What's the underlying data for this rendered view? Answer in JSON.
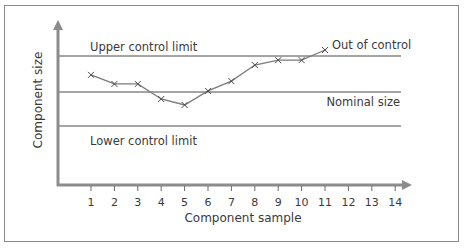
{
  "chart_data": {
    "type": "line",
    "title": "",
    "xlabel": "Component sample",
    "ylabel": "Component size",
    "x": [
      1,
      2,
      3,
      4,
      5,
      6,
      7,
      8,
      9,
      10,
      11,
      12,
      13,
      14
    ],
    "x_ticks": [
      "1",
      "2",
      "3",
      "4",
      "5",
      "6",
      "7",
      "8",
      "9",
      "10",
      "11",
      "12",
      "13",
      "14"
    ],
    "series": [
      {
        "name": "Component size",
        "marker": "x",
        "x": [
          1,
          2,
          3,
          4,
          5,
          6,
          7,
          8,
          9,
          10,
          11
        ],
        "values": [
          0.49,
          0.23,
          0.23,
          -0.2,
          -0.37,
          0.03,
          0.31,
          0.77,
          0.91,
          0.91,
          1.2
        ]
      }
    ],
    "reference_lines": [
      {
        "name": "Upper control limit",
        "value": 1,
        "label": "Upper control limit"
      },
      {
        "name": "Nominal size",
        "value": 0,
        "label": "Nominal size"
      },
      {
        "name": "Lower control limit",
        "value": -1,
        "label": "Lower control limit"
      }
    ],
    "annotations": [
      {
        "text": "Out of control",
        "x": 11,
        "value": 1.2
      }
    ],
    "ylim": [
      -1.7,
      1.9
    ],
    "xlim": [
      0,
      14.5
    ],
    "grid": false,
    "legend": "none",
    "y_ticks": "none"
  },
  "labels": {
    "ucl": "Upper control limit",
    "nominal": "Nominal size",
    "lcl": "Lower control limit",
    "out_of_control": "Out of control",
    "xlabel": "Component sample",
    "ylabel": "Component size"
  },
  "colors": {
    "axis": "#8c8c8c",
    "lines": "#4a4a4a",
    "series": "#7a7a7a",
    "text": "#3a3a3a",
    "frame": "#8a8a8a"
  }
}
